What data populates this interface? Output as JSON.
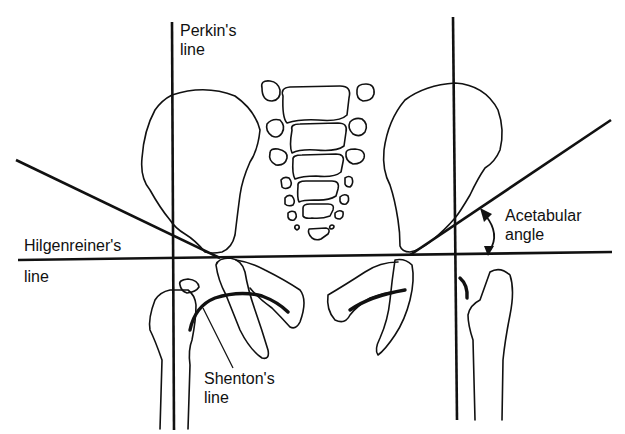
{
  "diagram": {
    "labels": {
      "perkins_line": [
        "Perkin's",
        "line"
      ],
      "hilgenreiners_line": [
        "Hilgenreiner's",
        "line"
      ],
      "acetabular_angle": [
        "Acetabular",
        "angle"
      ],
      "shentons_line": [
        "Shenton's",
        "line"
      ]
    },
    "elements": [
      {
        "id": "perkins-line-left",
        "type": "vertical-line"
      },
      {
        "id": "perkins-line-right",
        "type": "vertical-line"
      },
      {
        "id": "hilgenreiners-line",
        "type": "horizontal-line"
      },
      {
        "id": "acetabular-line-left",
        "type": "oblique-line"
      },
      {
        "id": "acetabular-line-right",
        "type": "oblique-line"
      },
      {
        "id": "acetabular-angle-arrow",
        "type": "double-arrow-arc"
      },
      {
        "id": "shentons-line-left",
        "type": "curved-line"
      },
      {
        "id": "shentons-line-right",
        "type": "curved-line"
      },
      {
        "id": "sacrum",
        "type": "bone-outline"
      },
      {
        "id": "ilium-left",
        "type": "bone-outline"
      },
      {
        "id": "ilium-right",
        "type": "bone-outline"
      },
      {
        "id": "femur-left",
        "type": "bone-outline"
      },
      {
        "id": "femur-right",
        "type": "bone-outline"
      },
      {
        "id": "ischium-pubis-left",
        "type": "bone-outline"
      },
      {
        "id": "ischium-pubis-right",
        "type": "bone-outline"
      }
    ]
  }
}
